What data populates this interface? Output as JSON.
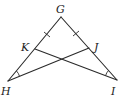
{
  "diagram": {
    "type": "geometry-triangle",
    "points": {
      "G": {
        "label": "G",
        "x": 61,
        "y": 17
      },
      "H": {
        "label": "H",
        "x": 8,
        "y": 81
      },
      "I": {
        "label": "I",
        "x": 117,
        "y": 80
      },
      "K": {
        "label": "K",
        "x": 35,
        "y": 49
      },
      "J": {
        "label": "J",
        "x": 89,
        "y": 48
      }
    },
    "segments": [
      "GH",
      "GI",
      "HJ",
      "IK"
    ],
    "congruence_marks": {
      "tick_marks": [
        "GK",
        "GJ"
      ],
      "angle_marks": [
        "GHJ",
        "GIK"
      ]
    },
    "colors": {
      "stroke": "#2a2a2a",
      "background": "#ffffff"
    }
  }
}
